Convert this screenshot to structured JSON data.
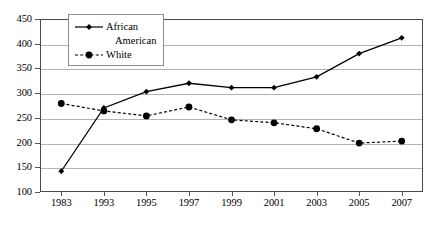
{
  "chart_data": {
    "type": "line",
    "title": "",
    "subtitle": "",
    "xlabel": "",
    "ylabel": "",
    "categories": [
      "1983",
      "1993",
      "1995",
      "1997",
      "1999",
      "2001",
      "2003",
      "2005",
      "2007"
    ],
    "ylim": [
      100,
      450
    ],
    "ytick_values": [
      100,
      150,
      200,
      250,
      300,
      350,
      400,
      450
    ],
    "ytick_labels": [
      "100",
      "150",
      "200",
      "250",
      "300",
      "350",
      "400",
      "450"
    ],
    "grid": true,
    "legend_position": "top-left-inside",
    "series": [
      {
        "name": "African American",
        "name_line1": "African",
        "name_line2": "American",
        "line_style": "solid",
        "color": "#000000",
        "marker": "diamond",
        "values": [
          142,
          270,
          303,
          320,
          311,
          311,
          333,
          380,
          412
        ]
      },
      {
        "name": "White",
        "name_line1": "White",
        "name_line2": "",
        "line_style": "dashed",
        "color": "#000000",
        "marker": "circle",
        "values": [
          279,
          264,
          254,
          272,
          246,
          240,
          228,
          199,
          203
        ]
      }
    ]
  },
  "colors": {
    "frame": "#4a4a4a",
    "gridline": "#b3b3b3",
    "series_line": "#000000",
    "background": "#ffffff"
  }
}
